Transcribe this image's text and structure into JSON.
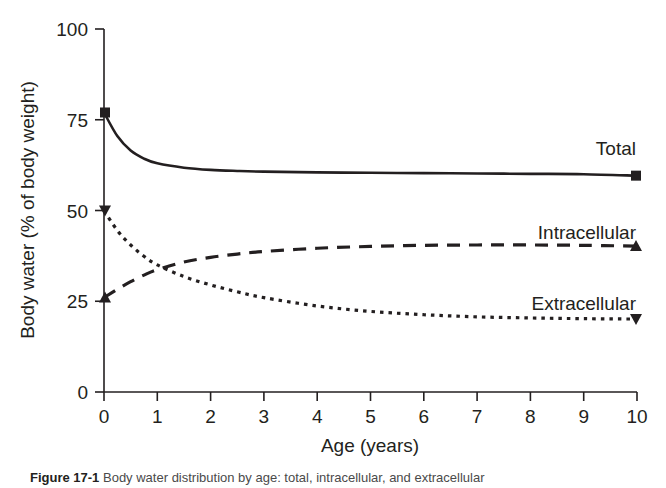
{
  "chart_data": {
    "type": "line",
    "title": "",
    "xlabel": "Age (years)",
    "ylabel": "Body water (% of body weight)",
    "xlim": [
      0,
      10
    ],
    "ylim": [
      0,
      100
    ],
    "xticks": [
      "0",
      "1",
      "2",
      "3",
      "4",
      "5",
      "6",
      "7",
      "8",
      "9",
      "10"
    ],
    "yticks": [
      "0",
      "25",
      "50",
      "75",
      "100"
    ],
    "grid": false,
    "legend_position": "inline-right",
    "x": [
      0,
      0.25,
      0.5,
      0.75,
      1,
      1.5,
      2,
      2.5,
      3,
      4,
      5,
      6,
      7,
      8,
      9,
      10
    ],
    "series": [
      {
        "name": "Total",
        "label": "Total",
        "linestyle": "solid",
        "marker": "square",
        "color": "#231f20",
        "values": [
          77,
          70.5,
          66.5,
          64.3,
          63,
          61.8,
          61.2,
          60.9,
          60.7,
          60.5,
          60.4,
          60.3,
          60.2,
          60.1,
          60.0,
          59.6
        ]
      },
      {
        "name": "Intracellular",
        "label": "Intracellular",
        "linestyle": "dashed",
        "marker": "triangle-up",
        "color": "#231f20",
        "values": [
          26,
          28.3,
          30.4,
          32.2,
          33.7,
          35.8,
          37.1,
          38.0,
          38.7,
          39.6,
          40.1,
          40.4,
          40.5,
          40.5,
          40.4,
          40.2
        ]
      },
      {
        "name": "Extracellular",
        "label": "Extracellular",
        "linestyle": "dotted",
        "marker": "triangle-down",
        "color": "#231f20",
        "values": [
          50,
          44.5,
          40.5,
          37.4,
          35.0,
          31.8,
          29.5,
          27.6,
          26.0,
          23.7,
          22.2,
          21.3,
          20.7,
          20.4,
          20.2,
          20.1
        ]
      }
    ]
  },
  "caption": {
    "figure_number": "Figure 17-1",
    "text": "Body water distribution by age: total, intracellular, and extracellular"
  }
}
